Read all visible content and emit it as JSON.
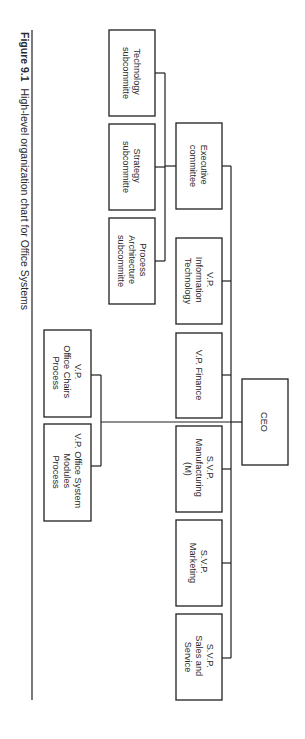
{
  "caption": {
    "figure_label": "Figure 9.1",
    "text": "High-level organization chart for Office Systems"
  },
  "orientation": "rotated 90deg clockwise",
  "nodes": {
    "ceo": {
      "lines": [
        "CEO"
      ]
    },
    "executive_committee": {
      "lines": [
        "Executive",
        "committee"
      ]
    },
    "technology_subcommittee": {
      "lines": [
        "Technology",
        "subcommitte"
      ]
    },
    "strategy_subcommittee": {
      "lines": [
        "Strategy",
        "subcommitte"
      ]
    },
    "process_architecture_subcommittee": {
      "lines": [
        "Process",
        "Architecture",
        "subcommitte"
      ]
    },
    "vp_information_technology": {
      "lines": [
        "V.P.",
        "Information",
        "Technology"
      ]
    },
    "vp_finance": {
      "lines": [
        "V.P. Finance"
      ]
    },
    "svp_manufacturing": {
      "lines": [
        "S.V.P.",
        "Manufacturing",
        "(M)"
      ]
    },
    "svp_marketing": {
      "lines": [
        "S.V.P.",
        "Marketing"
      ]
    },
    "svp_sales_service": {
      "lines": [
        "S.V.P.",
        "Sales and",
        "Service"
      ]
    },
    "vp_office_chairs": {
      "lines": [
        "V.P.",
        "Office Chairs",
        "Process"
      ]
    },
    "vp_office_system_modules": {
      "lines": [
        "V.P. Office System",
        "Modules",
        "Process"
      ]
    }
  },
  "hierarchy": {
    "CEO": [
      "Executive committee",
      "V.P. Information Technology",
      "V.P. Finance",
      "S.V.P. Manufacturing (M)",
      "S.V.P. Marketing",
      "S.V.P. Sales and Service",
      "V.P. Office Chairs Process",
      "V.P. Office System Modules Process"
    ],
    "Executive committee": [
      "Technology subcommitte",
      "Strategy subcommitte",
      "Process Architecture subcommitte"
    ]
  }
}
